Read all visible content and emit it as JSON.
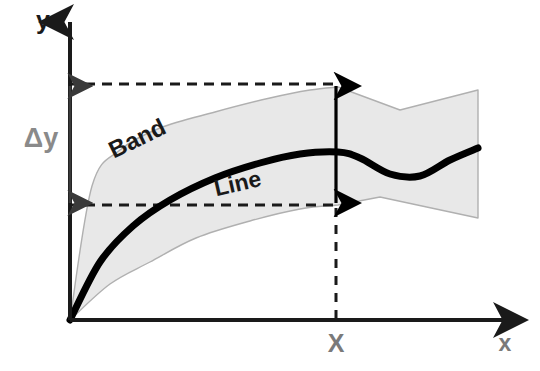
{
  "figure": {
    "type": "line-with-uncertainty-band-schematic",
    "background_color": "#ffffff",
    "axes": {
      "origin": [
        70,
        320
      ],
      "x_axis": {
        "label": "x",
        "label_color": "#7a7a7a",
        "label_position": [
          505,
          345
        ],
        "from": [
          70,
          320
        ],
        "to": [
          525,
          320
        ],
        "color": "#1a1a1a",
        "arrowhead": true
      },
      "y_axis": {
        "label": "y",
        "label_color": "#1a1a1a",
        "label_position": [
          43,
          22
        ],
        "from": [
          70,
          320
        ],
        "to": [
          70,
          22
        ],
        "color": "#1a1a1a",
        "arrowhead": true
      }
    },
    "band": {
      "label": "Band",
      "label_color": "#1a1a1a",
      "label_position": [
        138,
        140
      ],
      "label_rotation_deg": -26,
      "fill_color": "#e8e8e8",
      "stroke_color": "#b0b0b0",
      "stroke_width": 1.4,
      "upper_points": [
        [
          70,
          320
        ],
        [
          92,
          186
        ],
        [
          120,
          150
        ],
        [
          160,
          128
        ],
        [
          215,
          112
        ],
        [
          270,
          98
        ],
        [
          310,
          90
        ],
        [
          338,
          87
        ],
        [
          400,
          110
        ],
        [
          478,
          90
        ]
      ],
      "lower_points": [
        [
          70,
          320
        ],
        [
          110,
          284
        ],
        [
          150,
          262
        ],
        [
          196,
          238
        ],
        [
          250,
          221
        ],
        [
          300,
          209
        ],
        [
          338,
          205
        ],
        [
          380,
          197
        ],
        [
          478,
          218
        ]
      ]
    },
    "line": {
      "label": "Line",
      "label_color": "#1a1a1a",
      "label_position": [
        238,
        185
      ],
      "label_rotation_deg": -13,
      "stroke_color": "#000000",
      "stroke_width": 7,
      "points": [
        [
          70,
          320
        ],
        [
          100,
          262
        ],
        [
          133,
          226
        ],
        [
          170,
          200
        ],
        [
          215,
          178
        ],
        [
          260,
          163
        ],
        [
          300,
          154
        ],
        [
          338,
          152
        ],
        [
          360,
          158
        ],
        [
          390,
          174
        ],
        [
          420,
          176
        ],
        [
          450,
          160
        ],
        [
          478,
          148
        ]
      ]
    },
    "dashed_lines": [
      {
        "name": "upper-reference-line",
        "y": 84,
        "x_from": 68,
        "x_to": 340,
        "color": "#1a1a1a",
        "dash": "10 7",
        "width": 3
      },
      {
        "name": "lower-reference-line",
        "y": 205,
        "x_from": 68,
        "x_to": 340,
        "color": "#1a1a1a",
        "dash": "10 7",
        "width": 3
      },
      {
        "name": "x-marker-drop-line",
        "x": 336,
        "y_from": 208,
        "y_to": 320,
        "color": "#1a1a1a",
        "dash": "9 8",
        "width": 3
      }
    ],
    "measurements": [
      {
        "name": "delta-y-arrow",
        "label": "Δy",
        "label_color": "#8a8a8a",
        "label_position": [
          41,
          140
        ],
        "x": 70,
        "y_top": 86,
        "y_bottom": 203,
        "color": "#3a3a3a",
        "double_headed": true,
        "width": 2.6
      },
      {
        "name": "band-width-arrow-at-x",
        "label": "",
        "x": 336,
        "y_top": 86,
        "y_bottom": 203,
        "color": "#000000",
        "double_headed": true,
        "width": 3.2
      }
    ],
    "x_marker": {
      "label": "X",
      "label_color": "#7a7a7a",
      "label_position": [
        336,
        345
      ]
    }
  }
}
